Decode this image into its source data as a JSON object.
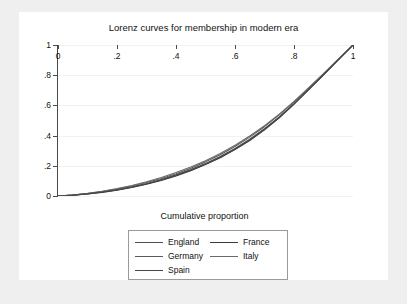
{
  "chart_data": {
    "type": "line",
    "title": "Lorenz curves for membership in modern era",
    "xlabel": "Cumulative proportion",
    "ylabel": "Lorenz memberships (by league)",
    "xlim": [
      0,
      1
    ],
    "ylim": [
      0,
      1
    ],
    "xticks": [
      "0",
      ".2",
      ".4",
      ".6",
      ".8",
      "1"
    ],
    "xtick_values": [
      0,
      0.2,
      0.4,
      0.6,
      0.8,
      1
    ],
    "yticks": [
      "0",
      ".2",
      ".4",
      ".6",
      ".8",
      "1"
    ],
    "ytick_values": [
      0,
      0.2,
      0.4,
      0.6,
      0.8,
      1
    ],
    "grid": "horizontal",
    "legend_position": "below-plot",
    "x": [
      0.0,
      0.05,
      0.1,
      0.15,
      0.2,
      0.25,
      0.3,
      0.35,
      0.4,
      0.45,
      0.5,
      0.55,
      0.6,
      0.65,
      0.7,
      0.75,
      0.8,
      0.85,
      0.9,
      0.95,
      1.0
    ],
    "series": [
      {
        "name": "England",
        "color": "#4d4d4d",
        "values": [
          0.0,
          0.006,
          0.015,
          0.027,
          0.042,
          0.061,
          0.083,
          0.109,
          0.14,
          0.175,
          0.215,
          0.262,
          0.315,
          0.376,
          0.445,
          0.524,
          0.612,
          0.708,
          0.804,
          0.903,
          1.0
        ]
      },
      {
        "name": "France",
        "color": "#3a3a3a",
        "values": [
          0.0,
          0.005,
          0.013,
          0.024,
          0.038,
          0.056,
          0.078,
          0.103,
          0.133,
          0.168,
          0.208,
          0.254,
          0.307,
          0.368,
          0.438,
          0.518,
          0.608,
          0.705,
          0.803,
          0.902,
          1.0
        ]
      },
      {
        "name": "Germany",
        "color": "#5a5a5a",
        "values": [
          0.0,
          0.007,
          0.017,
          0.03,
          0.046,
          0.066,
          0.089,
          0.116,
          0.148,
          0.184,
          0.226,
          0.273,
          0.328,
          0.39,
          0.459,
          0.537,
          0.622,
          0.715,
          0.809,
          0.905,
          1.0
        ]
      },
      {
        "name": "Italy",
        "color": "#6a6a6a",
        "values": [
          0.0,
          0.007,
          0.018,
          0.032,
          0.049,
          0.07,
          0.094,
          0.122,
          0.155,
          0.192,
          0.234,
          0.282,
          0.336,
          0.397,
          0.465,
          0.542,
          0.626,
          0.717,
          0.81,
          0.906,
          1.0
        ]
      },
      {
        "name": "Spain",
        "color": "#474747",
        "values": [
          0.0,
          0.006,
          0.014,
          0.026,
          0.04,
          0.058,
          0.08,
          0.106,
          0.136,
          0.171,
          0.211,
          0.257,
          0.31,
          0.371,
          0.44,
          0.52,
          0.609,
          0.706,
          0.803,
          0.902,
          1.0
        ]
      }
    ]
  },
  "legend": {
    "entries": [
      {
        "label": "England",
        "color": "#4d4d4d"
      },
      {
        "label": "France",
        "color": "#3a3a3a"
      },
      {
        "label": "Germany",
        "color": "#5a5a5a"
      },
      {
        "label": "Italy",
        "color": "#6a6a6a"
      },
      {
        "label": "Spain",
        "color": "#474747"
      }
    ]
  },
  "colors": {
    "page_background": "#efefef",
    "plot_background": "#ffffff",
    "axis": "#4a4a4a",
    "gridline": "#f2f2f2",
    "legend_border": "#9a9a9a",
    "text": "#111111"
  }
}
